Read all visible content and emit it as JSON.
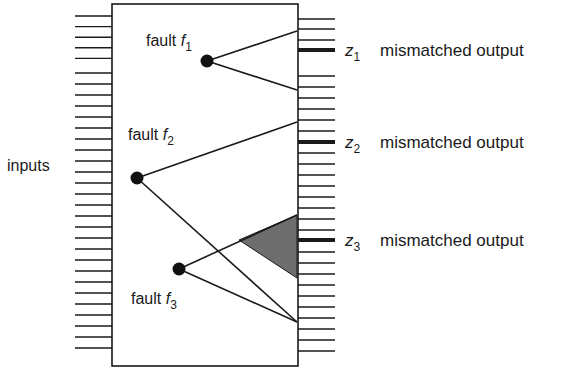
{
  "labels": {
    "inputs": "inputs",
    "fault_word": "fault",
    "output_text": "mismatched output"
  },
  "faults": [
    {
      "id": "f1",
      "var": "f",
      "sub": "1",
      "dot": [
        207,
        61
      ],
      "ends": [
        [
          297,
          31
        ],
        [
          297,
          90
        ]
      ],
      "label_pos": [
        146,
        46
      ]
    },
    {
      "id": "f2",
      "var": "f",
      "sub": "2",
      "dot": [
        137,
        178
      ],
      "ends": [
        [
          297,
          122
        ],
        [
          297,
          322
        ]
      ],
      "label_pos": [
        128,
        140
      ]
    },
    {
      "id": "f3",
      "var": "f",
      "sub": "3",
      "dot": [
        179,
        269
      ],
      "ends": [
        [
          297,
          215
        ],
        [
          297,
          322
        ]
      ],
      "label_pos": [
        131,
        304
      ]
    }
  ],
  "outputs": [
    {
      "id": "z1",
      "var": "z",
      "sub": "1",
      "y": 50
    },
    {
      "id": "z2",
      "var": "z",
      "sub": "2",
      "y": 142
    },
    {
      "id": "z3",
      "var": "z",
      "sub": "3",
      "y": 240
    }
  ],
  "shaded_region": {
    "points": [
      [
        239,
        240
      ],
      [
        297,
        215
      ],
      [
        297,
        278
      ]
    ],
    "color": "#6e6e6e"
  },
  "colors": {
    "stroke": "#1a1a1a",
    "shade": "#6e6e6e"
  }
}
